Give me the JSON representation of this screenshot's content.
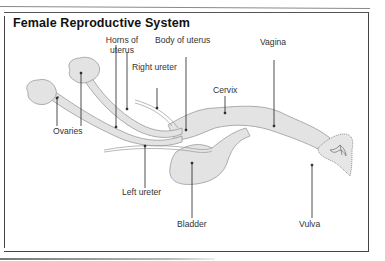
{
  "title": "Female Reproductive System",
  "labels": {
    "horns_line1": "Horns of",
    "horns_line2": "uterus",
    "body_of_uterus": "Body of uterus",
    "right_ureter": "Right ureter",
    "vagina": "Vagina",
    "cervix": "Cervix",
    "ovaries": "Ovaries",
    "left_ureter": "Left ureter",
    "bladder": "Bladder",
    "vulva": "Vulva"
  },
  "colors": {
    "organ_fill": "#e3e3e3",
    "organ_stroke": "#9a9a9a",
    "leader_line": "#222222",
    "text": "#333333"
  }
}
